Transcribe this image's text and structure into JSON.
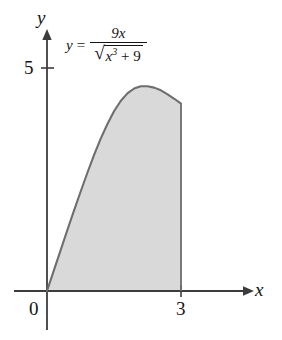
{
  "figure": {
    "equation": {
      "lhs": "y",
      "eq_sign": "=",
      "numerator": "9x",
      "radicand_base": "x",
      "radicand_exponent": "3",
      "radicand_plus": " + ",
      "radicand_constant": "9",
      "radical_sign": "√",
      "full_text": "y = 9x / sqrt(x^3 + 9)"
    },
    "axes": {
      "x_label": "x",
      "y_label": "y",
      "origin_label": "0",
      "y_tick_label": "5",
      "x_tick_label": "3"
    },
    "colors": {
      "axis": "#3c3c3c",
      "curve": "#6e6e6e",
      "shading": "#d9d9d9",
      "text": "#141414",
      "background": "#ffffff"
    }
  },
  "chart_data": {
    "type": "area",
    "title": "",
    "subtitle": "",
    "xlabel": "x",
    "ylabel": "y",
    "function": "y = 9x / sqrt(x^3 + 9)",
    "grid": false,
    "legend": null,
    "xlim": [
      -0.4,
      3.75
    ],
    "ylim": [
      -0.75,
      5.9
    ],
    "xticks": [
      0,
      3
    ],
    "xtick_labels": [
      "0",
      "3"
    ],
    "yticks": [
      5
    ],
    "ytick_labels": [
      "5"
    ],
    "shaded_region": {
      "from_x": 0,
      "to_x": 3,
      "bounded_below_by": "y = 0",
      "bounded_above_by": "y = 9x / sqrt(x^3 + 9)",
      "fill": "#d9d9d9"
    },
    "x": [
      0,
      0.15,
      0.3,
      0.45,
      0.6,
      0.75,
      0.9,
      1.05,
      1.2,
      1.35,
      1.5,
      1.65,
      1.8,
      1.95,
      2.1,
      2.25,
      2.4,
      2.55,
      2.7,
      2.85,
      3
    ],
    "y": [
      0,
      0.45,
      0.9,
      1.35,
      1.79,
      2.22,
      2.64,
      3.04,
      3.41,
      3.74,
      4.03,
      4.26,
      4.43,
      4.54,
      4.59,
      4.59,
      4.56,
      4.5,
      4.41,
      4.31,
      4.2
    ],
    "annotations": [
      {
        "text": "y = 9x / sqrt(x^3 + 9)",
        "x": 1.4,
        "y": 5.45
      }
    ]
  }
}
